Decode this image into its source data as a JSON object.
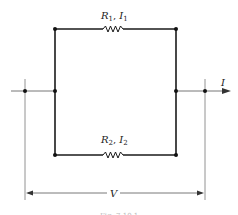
{
  "diagram": {
    "type": "parallel-resistor-circuit",
    "branches": [
      {
        "resistor": "R",
        "resistor_sub": "1",
        "current": "I",
        "current_sub": "1",
        "position": "top"
      },
      {
        "resistor": "R",
        "resistor_sub": "2",
        "current": "I",
        "current_sub": "2",
        "position": "bottom"
      }
    ],
    "total_current_label": "I",
    "voltage_label": "V",
    "separator": ", ",
    "caption": "Fig. 7.10.1",
    "colors": {
      "wire": "#1a1a1a",
      "thin_line": "#555555",
      "background": "#ffffff"
    }
  }
}
